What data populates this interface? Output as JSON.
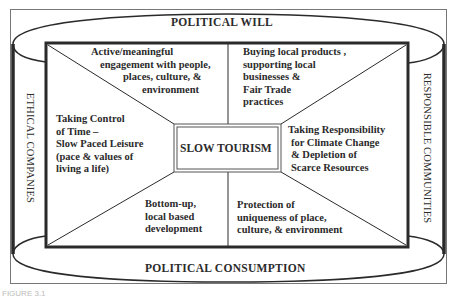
{
  "diagram": {
    "type": "conceptual framework",
    "center": "SLOW TOURISM",
    "frame": {
      "top": "POLITICAL WILL",
      "bottom": "POLITICAL CONSUMPTION",
      "left": "ETHICAL COMPANIES",
      "right": "RESPONSIBLE COMMUNITIES"
    },
    "segments": {
      "top_left": [
        "Active/meaningful",
        "engagement with people,",
        "places, culture, &",
        "environment"
      ],
      "top_right": [
        "Buying local products ,",
        "supporting local",
        "businesses &",
        "Fair Trade",
        "practices"
      ],
      "left": [
        "Taking Control",
        "of Time –",
        "Slow Paced Leisure",
        "(pace & values of",
        "living a life)"
      ],
      "right": [
        "Taking Responsibility",
        "for Climate Change",
        "& Depletion of",
        "Scarce Resources"
      ],
      "bottom_left": [
        "Bottom-up,",
        "local based",
        "development"
      ],
      "bottom_right": [
        "Protection of",
        "uniqueness of place,",
        "culture, & environment"
      ]
    },
    "caption": "FIGURE 3.1"
  },
  "colors": {
    "line": "#2a2a2a",
    "frame": "#6a6a6a",
    "background": "#ffffff"
  }
}
